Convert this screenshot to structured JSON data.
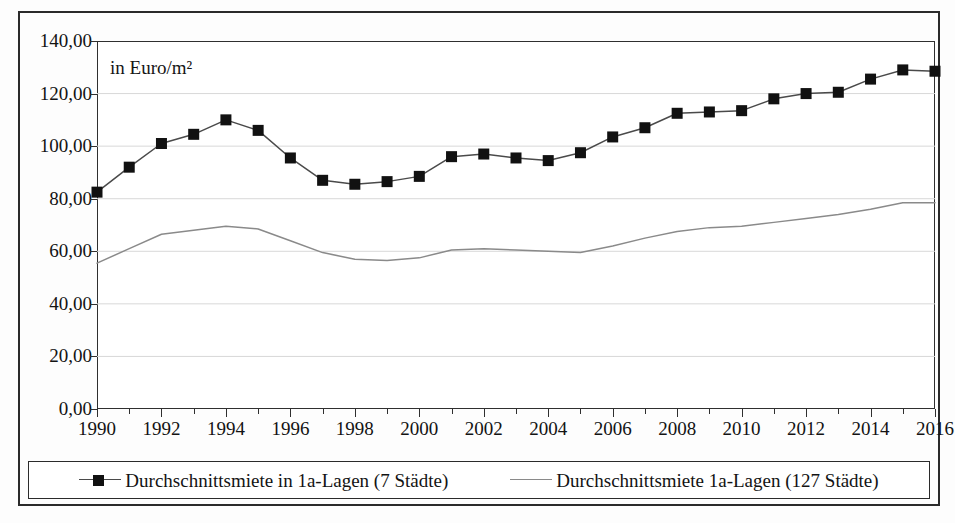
{
  "chart_data": {
    "type": "line",
    "title": "",
    "subtitle": "",
    "annotation": "in Euro/m²",
    "xlabel": "",
    "ylabel": "",
    "xlim": [
      1990,
      2016
    ],
    "ylim": [
      0,
      140
    ],
    "grid": true,
    "grid_axis": "y",
    "legend_position": "bottom",
    "x": [
      1990,
      1991,
      1992,
      1993,
      1994,
      1995,
      1996,
      1997,
      1998,
      1999,
      2000,
      2001,
      2002,
      2003,
      2004,
      2005,
      2006,
      2007,
      2008,
      2009,
      2010,
      2011,
      2012,
      2013,
      2014,
      2015,
      2016
    ],
    "xtick_labels": [
      "1990",
      "1992",
      "1994",
      "1996",
      "1998",
      "2000",
      "2002",
      "2004",
      "2006",
      "2008",
      "2010",
      "2012",
      "2014",
      "2016"
    ],
    "xtick_values": [
      1990,
      1992,
      1994,
      1996,
      1998,
      2000,
      2002,
      2004,
      2006,
      2008,
      2010,
      2012,
      2014,
      2016
    ],
    "ytick_labels": [
      "140,00",
      "120,00",
      "100,00",
      "80,00",
      "60,00",
      "40,00",
      "20,00",
      "0,00"
    ],
    "ytick_values": [
      140,
      120,
      100,
      80,
      60,
      40,
      20,
      0
    ],
    "series": [
      {
        "name": "Durchschnittsmiete in 1a-Lagen (7 Städte)",
        "marker": "square",
        "color": "#111111",
        "line_color": "#4a4a4a",
        "values": [
          82.5,
          92.0,
          101.0,
          104.5,
          110.0,
          106.0,
          95.5,
          87.0,
          85.5,
          86.5,
          88.5,
          96.0,
          97.0,
          95.5,
          94.5,
          97.5,
          103.5,
          107.0,
          112.5,
          113.0,
          113.5,
          118.0,
          120.0,
          120.5,
          125.5,
          129.0,
          128.5
        ]
      },
      {
        "name": "Durchschnittsmiete 1a-Lagen (127 Städte)",
        "marker": "none",
        "color": "#8a8a8a",
        "line_color": "#8a8a8a",
        "values": [
          55.5,
          61.0,
          66.5,
          68.0,
          69.5,
          68.5,
          64.0,
          59.5,
          57.0,
          56.5,
          57.5,
          60.5,
          61.0,
          60.5,
          60.0,
          59.5,
          62.0,
          65.0,
          67.5,
          69.0,
          69.5,
          71.0,
          72.5,
          74.0,
          76.0,
          78.5,
          78.5
        ]
      }
    ]
  },
  "legend": {
    "entries": [
      {
        "label": "Durchschnittsmiete in 1a-Lagen (7 Städte)",
        "swatch": "line-with-square-marker"
      },
      {
        "label": "Durchschnittsmiete 1a-Lagen (127 Städte)",
        "swatch": "plain-line"
      }
    ]
  },
  "colors": {
    "series_1": "#111111",
    "series_2": "#8a8a8a",
    "axis": "#2f2f2f",
    "grid": "#d8d8d8",
    "border": "#2b2b2b",
    "background": "#ffffff"
  }
}
